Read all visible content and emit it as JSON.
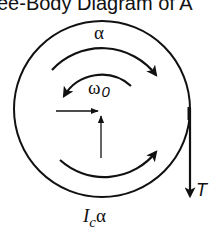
{
  "title": "ee-Body Diagram of A",
  "labels": {
    "alpha": "α",
    "omega": "ω",
    "omega_sub": "0",
    "tension": "T",
    "inertia_I": "I",
    "inertia_sub": "c",
    "inertia_alpha": "α"
  },
  "colors": {
    "stroke": "#111111",
    "background": "#ffffff"
  }
}
